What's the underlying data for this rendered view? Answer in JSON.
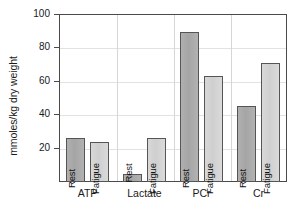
{
  "chart_data": {
    "type": "bar",
    "title": "",
    "xlabel": "",
    "ylabel": "mmoles/kg dry weight",
    "ylim": [
      0,
      100
    ],
    "yticks": [
      0,
      20,
      40,
      60,
      80,
      100
    ],
    "ytick_labels": [
      "",
      "20",
      "40",
      "60",
      "80",
      "100"
    ],
    "grid": true,
    "legend_position": "none",
    "categories": [
      "ATP",
      "Lactate",
      "PCr",
      "Cr"
    ],
    "series": [
      {
        "name": "Rest",
        "values": [
          26,
          5,
          89,
          45
        ]
      },
      {
        "name": "Fatigue",
        "values": [
          24,
          26,
          63,
          71
        ]
      }
    ],
    "bar_labels": [
      [
        "Rest",
        "Fatigue"
      ],
      [
        "Rest",
        "Fatigue"
      ],
      [
        "Rest",
        "Fatigue"
      ],
      [
        "Rest",
        "Fatigue"
      ]
    ],
    "colors": {
      "rest": "#a8a8a8",
      "fatigue": "#d4d4d4",
      "bar_border": "#555555",
      "axis": "#4a4a4a",
      "grid": "#e2e2e2",
      "text": "#1a1a1a",
      "background": "#ffffff"
    },
    "annotations": []
  },
  "axis": {
    "tick_labels": [
      "100",
      "80",
      "60",
      "40",
      "20"
    ],
    "y_title": "mmoles/kg dry weight"
  },
  "categories": {
    "list": [
      "ATP",
      "Lactate",
      "PCr",
      "Cr"
    ]
  },
  "bars": {
    "atp_rest_label": "Rest",
    "atp_fatigue_label": "Fatigue",
    "lactate_rest_label": "Rest",
    "lactate_fatigue_label": "Fatigue",
    "pcr_rest_label": "Rest",
    "pcr_fatigue_label": "Fatigue",
    "cr_rest_label": "Rest",
    "cr_fatigue_label": "Fatigue"
  }
}
